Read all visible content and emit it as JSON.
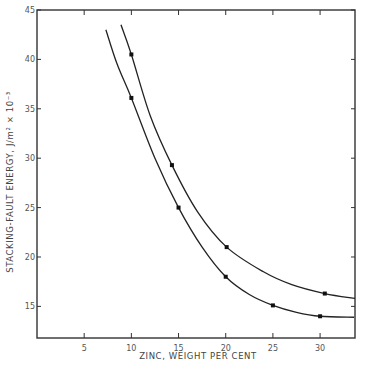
{
  "chart_data": {
    "type": "line",
    "title": "",
    "xlabel": "ZINC, WEIGHT PER CENT",
    "ylabel": "STACKING-FAULT ENERGY, J/m² × 10⁻³",
    "xlim": [
      0,
      33.7
    ],
    "ylim": [
      11.8,
      45
    ],
    "xticks": [
      5,
      10,
      15,
      20,
      25,
      30
    ],
    "yticks": [
      15,
      20,
      25,
      30,
      35,
      40,
      45
    ],
    "grid": false,
    "legend": null,
    "series": [
      {
        "name": "upper curve",
        "markers": [
          {
            "x": 10,
            "y": 40.5
          },
          {
            "x": 14.3,
            "y": 29.3
          },
          {
            "x": 20.1,
            "y": 21.0
          },
          {
            "x": 30.5,
            "y": 16.3
          }
        ],
        "curve": [
          [
            8.9,
            43.5
          ],
          [
            10,
            40.5
          ],
          [
            12,
            34.3
          ],
          [
            14.3,
            29.3
          ],
          [
            17,
            24.6
          ],
          [
            20.1,
            21.0
          ],
          [
            24,
            18.5
          ],
          [
            27,
            17.2
          ],
          [
            30.5,
            16.3
          ],
          [
            33.7,
            15.8
          ]
        ]
      },
      {
        "name": "lower curve",
        "markers": [
          {
            "x": 10,
            "y": 36.1
          },
          {
            "x": 15,
            "y": 25.0
          },
          {
            "x": 20,
            "y": 18.0
          },
          {
            "x": 25,
            "y": 15.1
          },
          {
            "x": 30,
            "y": 14.0
          }
        ],
        "curve": [
          [
            7.3,
            43.0
          ],
          [
            8.5,
            39.5
          ],
          [
            10,
            36.1
          ],
          [
            12.5,
            30.0
          ],
          [
            15,
            25.0
          ],
          [
            17.5,
            21.0
          ],
          [
            20,
            18.0
          ],
          [
            22.5,
            16.2
          ],
          [
            25,
            15.1
          ],
          [
            27.5,
            14.4
          ],
          [
            30,
            14.0
          ],
          [
            33.6,
            13.9
          ]
        ]
      }
    ]
  },
  "axes": {
    "x_title": "ZINC, WEIGHT PER CENT",
    "y_title": "STACKING-FAULT ENERGY, J/m² × 10⁻³"
  }
}
